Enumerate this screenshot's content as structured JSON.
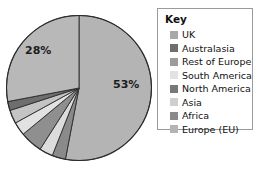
{
  "chart_data": {
    "type": "pie",
    "title": "",
    "legend_title": "Key",
    "legend_position": "right",
    "labels_shown": [
      "53%",
      "28%"
    ],
    "categories": [
      "UK",
      "Australasia",
      "Rest of Europe",
      "South America",
      "North America",
      "Asia",
      "Africa",
      "Europe (EU)"
    ],
    "values": [
      53,
      2,
      3,
      3,
      5,
      3,
      3,
      28
    ],
    "colors": [
      "#a8a8a8",
      "#6e6e6e",
      "#9c9c9c",
      "#e2e2e2",
      "#787878",
      "#cfcfcf",
      "#8a8a8a",
      "#b4b4b4"
    ],
    "slices": [
      {
        "name": "UK",
        "value": 53,
        "label": "53%",
        "color": "#b4b4b4"
      },
      {
        "name": "Africa",
        "value": 3,
        "label": "",
        "color": "#8a8a8a"
      },
      {
        "name": "Asia",
        "value": 3,
        "label": "",
        "color": "#dcdcdc"
      },
      {
        "name": "North America",
        "value": 5,
        "label": "",
        "color": "#8f8f8f"
      },
      {
        "name": "South America",
        "value": 3,
        "label": "",
        "color": "#e2e2e2"
      },
      {
        "name": "Rest of Europe",
        "value": 3,
        "label": "",
        "color": "#c4c4c4"
      },
      {
        "name": "Australasia",
        "value": 2,
        "label": "",
        "color": "#6e6e6e"
      },
      {
        "name": "Europe (EU)",
        "value": 28,
        "label": "28%",
        "color": "#b8b8b8"
      }
    ]
  },
  "pie": {
    "label_eu": "28%",
    "label_uk": "53%"
  },
  "legend": {
    "title": "Key",
    "items": [
      {
        "label": "UK",
        "color": "#a8a8a8"
      },
      {
        "label": "Australasia",
        "color": "#6e6e6e"
      },
      {
        "label": "Rest of Europe",
        "color": "#9c9c9c"
      },
      {
        "label": "South America",
        "color": "#e2e2e2"
      },
      {
        "label": "North America",
        "color": "#787878"
      },
      {
        "label": "Asia",
        "color": "#cfcfcf"
      },
      {
        "label": "Africa",
        "color": "#8a8a8a"
      },
      {
        "label": "Europe (EU)",
        "color": "#b4b4b4"
      }
    ]
  }
}
